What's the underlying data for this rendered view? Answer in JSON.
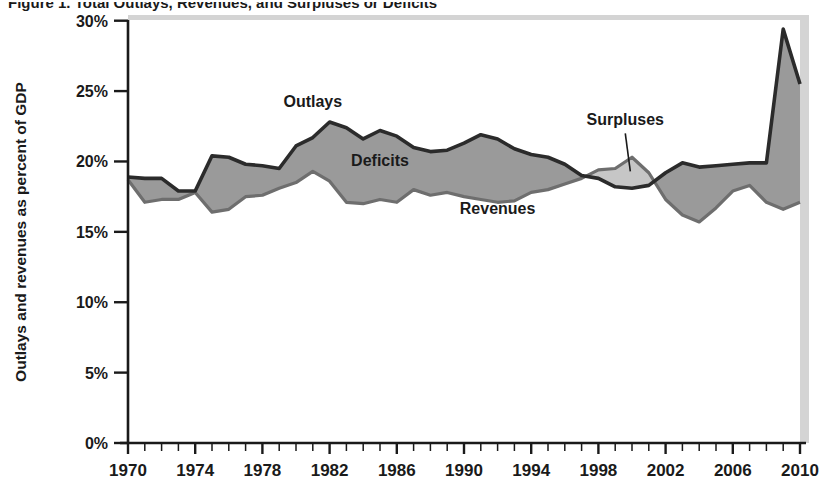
{
  "figure": {
    "title_clipped": "Figure 1. Total Outlays, Revenues, and Surpluses or Deficits",
    "title_visible_note": "title row cropped at top of image"
  },
  "chart_data": {
    "type": "area",
    "title": "",
    "xlabel": "",
    "ylabel": "Outlays and revenues as percent of GDP",
    "xlim": [
      1970,
      2010
    ],
    "ylim": [
      0,
      30
    ],
    "ytick_labels": [
      "0%",
      "5%",
      "10%",
      "15%",
      "20%",
      "25%",
      "30%"
    ],
    "ytick_values": [
      0,
      5,
      10,
      15,
      20,
      25,
      30
    ],
    "xtick_labels": [
      "1970",
      "1974",
      "1978",
      "1982",
      "1986",
      "1990",
      "1994",
      "1998",
      "2002",
      "2006",
      "2010"
    ],
    "xtick_values": [
      1970,
      1974,
      1978,
      1982,
      1986,
      1990,
      1994,
      1998,
      2002,
      2006,
      2010
    ],
    "minor_tick_interval_years": 1,
    "grid": false,
    "legend": "inline annotations",
    "annotations": [
      {
        "label": "Outlays",
        "x": 1981.0,
        "y": 23.9
      },
      {
        "label": "Deficits",
        "x": 1985.0,
        "y": 19.7
      },
      {
        "label": "Revenues",
        "x": 1992.0,
        "y": 16.3
      },
      {
        "label": "Surpluses",
        "x": 1999.6,
        "y": 22.6
      }
    ],
    "x": [
      1970,
      1971,
      1972,
      1973,
      1974,
      1975,
      1976,
      1977,
      1978,
      1979,
      1980,
      1981,
      1982,
      1983,
      1984,
      1985,
      1986,
      1987,
      1988,
      1989,
      1990,
      1991,
      1992,
      1993,
      1994,
      1995,
      1996,
      1997,
      1998,
      1999,
      2000,
      2001,
      2002,
      2003,
      2004,
      2005,
      2006,
      2007,
      2008,
      2009,
      2010
    ],
    "series": [
      {
        "name": "Outlays",
        "values": [
          18.9,
          18.8,
          18.8,
          17.9,
          17.9,
          20.4,
          20.3,
          19.8,
          19.7,
          19.5,
          21.1,
          21.7,
          22.8,
          22.4,
          21.6,
          22.2,
          21.8,
          21.0,
          20.7,
          20.8,
          21.3,
          21.9,
          21.6,
          20.9,
          20.5,
          20.3,
          19.8,
          19.0,
          18.8,
          18.2,
          18.1,
          18.3,
          19.2,
          19.9,
          19.6,
          19.7,
          19.8,
          19.9,
          19.9,
          29.4,
          25.5
        ]
      },
      {
        "name": "Revenues",
        "values": [
          18.7,
          17.1,
          17.3,
          17.3,
          17.8,
          16.4,
          16.6,
          17.5,
          17.6,
          18.1,
          18.5,
          19.3,
          18.6,
          17.1,
          17.0,
          17.3,
          17.1,
          18.0,
          17.6,
          17.8,
          17.5,
          17.3,
          17.1,
          17.2,
          17.8,
          18.0,
          18.4,
          18.8,
          19.4,
          19.5,
          20.3,
          19.2,
          17.3,
          16.2,
          15.7,
          16.7,
          17.9,
          18.3,
          17.1,
          16.6,
          17.1
        ]
      }
    ],
    "fill_regions": [
      {
        "name": "Deficits",
        "description": "area between Outlays (upper) and Revenues (lower)",
        "color": "#9a9a9a"
      },
      {
        "name": "Surpluses",
        "description": "area between Revenues (upper) and Outlays (lower), ~1998-2001",
        "color": "#c6c6c6"
      }
    ],
    "colors": {
      "outlays_line": "#2b2b2b",
      "revenues_line": "#6e6e6e",
      "deficit_fill": "#9a9a9a",
      "surplus_fill": "#c6c6c6",
      "axis": "#1a1a1a",
      "plot_background": "#ffffff",
      "shadow": "#d4d4d4"
    }
  }
}
